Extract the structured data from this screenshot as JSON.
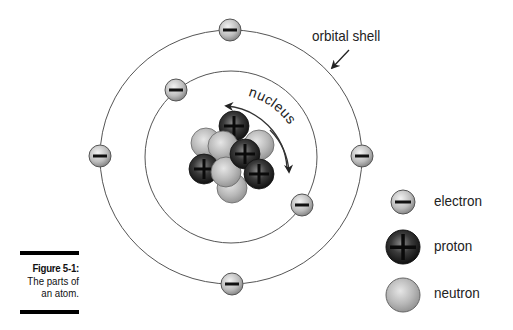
{
  "figure": {
    "number_label": "Figure 5-1:",
    "caption_line1": "The parts of",
    "caption_line2": "an atom."
  },
  "labels": {
    "orbital_shell": "orbital shell",
    "nucleus": "nucleus"
  },
  "legend": {
    "items": [
      {
        "key": "electron",
        "label": "electron",
        "symbol": "minus-sign"
      },
      {
        "key": "proton",
        "label": "proton",
        "symbol": "plus-sign"
      },
      {
        "key": "neutron",
        "label": "neutron",
        "symbol": "none"
      }
    ]
  },
  "colors": {
    "orbit_line": "#555555",
    "electron_fill": "#bdbdbd",
    "proton_fill": "#1a1a1a",
    "neutron_fill": "#b8b8b8",
    "text": "#222222"
  }
}
